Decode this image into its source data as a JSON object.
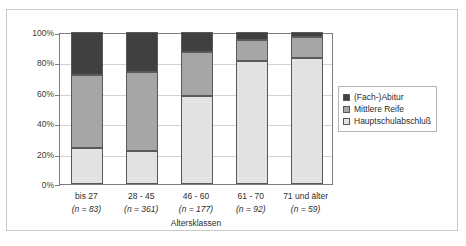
{
  "chart_data": {
    "type": "bar",
    "subtype": "stacked-percentage-column",
    "title": "",
    "xlabel": "Altersklassen",
    "ylabel": "",
    "ylim": [
      0,
      100
    ],
    "ytick_labels": [
      "100%",
      "80%",
      "60%",
      "40%",
      "20%",
      "0%"
    ],
    "ytick_values": [
      100,
      80,
      60,
      40,
      20,
      0
    ],
    "grid": true,
    "legend_position": "right",
    "categories": [
      "bis 27",
      "28 - 45",
      "46 - 60",
      "61 - 70",
      "71 und älter"
    ],
    "category_counts": [
      "(n = 83)",
      "(n = 361)",
      "(n = 177)",
      "(n = 92)",
      "(n = 59)"
    ],
    "series": [
      {
        "name": "Hauptschulabschluß",
        "color": "#e2e2e2",
        "values": [
          24,
          22,
          58,
          81,
          83
        ]
      },
      {
        "name": "Mittlere Reife",
        "color": "#a6a6a6",
        "values": [
          48,
          52,
          29,
          14,
          14
        ]
      },
      {
        "name": "(Fach-)Abitur",
        "color": "#404040",
        "values": [
          28,
          26,
          13,
          5,
          3
        ]
      }
    ]
  },
  "legend": {
    "items": [
      {
        "label": "(Fach-)Abitur",
        "color": "#404040"
      },
      {
        "label": "Mittlere Reife",
        "color": "#a6a6a6"
      },
      {
        "label": "Hauptschulabschluß",
        "color": "#e2e2e2"
      }
    ]
  },
  "axes": {
    "x_title": "Altersklassen",
    "y_ticks": [
      {
        "label": "100%",
        "value": 100
      },
      {
        "label": "80%",
        "value": 80
      },
      {
        "label": "60%",
        "value": 60
      },
      {
        "label": "40%",
        "value": 40
      },
      {
        "label": "20%",
        "value": 20
      },
      {
        "label": "0%",
        "value": 0
      }
    ]
  }
}
